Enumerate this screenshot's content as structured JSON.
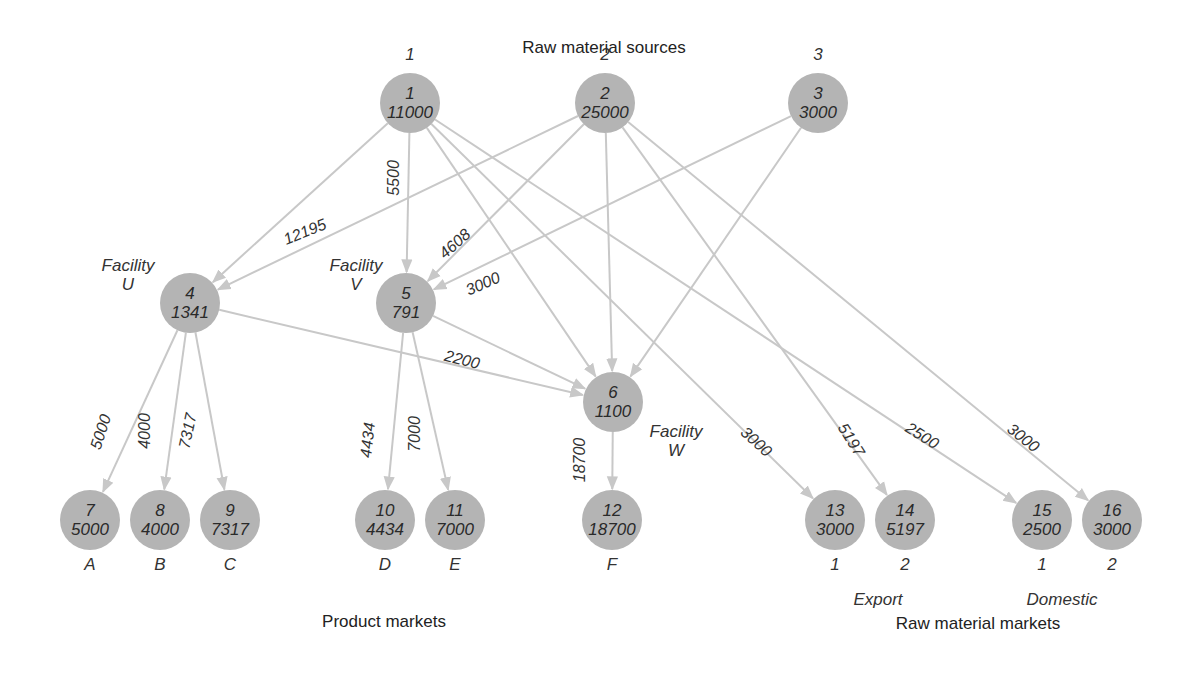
{
  "titles": {
    "sources": "Raw material sources",
    "product_markets": "Product markets",
    "raw_markets": "Raw material markets"
  },
  "colors": {
    "node_fill": "#b4b4b4",
    "edge": "#c8c8c8",
    "text": "#2a2a2a"
  },
  "nodes": [
    {
      "id": "1",
      "value": "11000",
      "x": 410,
      "y": 103,
      "above": "1"
    },
    {
      "id": "2",
      "value": "25000",
      "x": 605,
      "y": 103,
      "above": "2"
    },
    {
      "id": "3",
      "value": "3000",
      "x": 818,
      "y": 103,
      "above": "3"
    },
    {
      "id": "4",
      "value": "1341",
      "x": 190,
      "y": 303
    },
    {
      "id": "5",
      "value": "791",
      "x": 406,
      "y": 303
    },
    {
      "id": "6",
      "value": "1100",
      "x": 613,
      "y": 402
    },
    {
      "id": "7",
      "value": "5000",
      "x": 90,
      "y": 520,
      "below": "A"
    },
    {
      "id": "8",
      "value": "4000",
      "x": 160,
      "y": 520,
      "below": "B"
    },
    {
      "id": "9",
      "value": "7317",
      "x": 230,
      "y": 520,
      "below": "C"
    },
    {
      "id": "10",
      "value": "4434",
      "x": 385,
      "y": 520,
      "below": "D"
    },
    {
      "id": "11",
      "value": "7000",
      "x": 455,
      "y": 520,
      "below": "E"
    },
    {
      "id": "12",
      "value": "18700",
      "x": 612,
      "y": 520,
      "below": "F"
    },
    {
      "id": "13",
      "value": "3000",
      "x": 835,
      "y": 520,
      "below": "1"
    },
    {
      "id": "14",
      "value": "5197",
      "x": 905,
      "y": 520,
      "below": "2"
    },
    {
      "id": "15",
      "value": "2500",
      "x": 1042,
      "y": 520,
      "below": "1"
    },
    {
      "id": "16",
      "value": "3000",
      "x": 1112,
      "y": 520,
      "below": "2"
    }
  ],
  "facility_labels": [
    {
      "line1": "Facility",
      "line2": "U",
      "x": 128,
      "y": 256
    },
    {
      "line1": "Facility",
      "line2": "V",
      "x": 356,
      "y": 256
    },
    {
      "line1": "Facility",
      "line2": "W",
      "x": 676,
      "y": 422
    }
  ],
  "group_labels": [
    {
      "text": "Export",
      "x": 878,
      "y": 590
    },
    {
      "text": "Domestic",
      "x": 1062,
      "y": 590
    }
  ],
  "edges": [
    {
      "from": "1",
      "to": "4",
      "label": ""
    },
    {
      "from": "1",
      "to": "5",
      "label": "5500",
      "lx": 394,
      "ly": 178,
      "rot": -90
    },
    {
      "from": "1",
      "to": "6",
      "label": ""
    },
    {
      "from": "1",
      "to": "13",
      "label": "3000",
      "lx": 756,
      "ly": 442,
      "rot": 42
    },
    {
      "from": "1",
      "to": "15",
      "label": "2500",
      "lx": 922,
      "ly": 436,
      "rot": 32
    },
    {
      "from": "2",
      "to": "4",
      "label": "12195",
      "lx": 305,
      "ly": 232,
      "rot": -22
    },
    {
      "from": "2",
      "to": "5",
      "label": "4608",
      "lx": 455,
      "ly": 244,
      "rot": -42
    },
    {
      "from": "2",
      "to": "6",
      "label": ""
    },
    {
      "from": "2",
      "to": "14",
      "label": "5197",
      "lx": 851,
      "ly": 440,
      "rot": 58
    },
    {
      "from": "2",
      "to": "16",
      "label": "3000",
      "lx": 1023,
      "ly": 438,
      "rot": 38
    },
    {
      "from": "3",
      "to": "5",
      "label": "3000",
      "lx": 483,
      "ly": 284,
      "rot": -24
    },
    {
      "from": "3",
      "to": "6",
      "label": ""
    },
    {
      "from": "4",
      "to": "6",
      "label": "2200",
      "lx": 462,
      "ly": 360,
      "rot": 14
    },
    {
      "from": "4",
      "to": "7",
      "label": "5000",
      "lx": 101,
      "ly": 432,
      "rot": -72
    },
    {
      "from": "4",
      "to": "8",
      "label": "4000",
      "lx": 145,
      "ly": 431,
      "rot": -90
    },
    {
      "from": "4",
      "to": "9",
      "label": "7317",
      "lx": 188,
      "ly": 431,
      "rot": -78
    },
    {
      "from": "5",
      "to": "6",
      "label": ""
    },
    {
      "from": "5",
      "to": "10",
      "label": "4434",
      "lx": 368,
      "ly": 440,
      "rot": -84
    },
    {
      "from": "5",
      "to": "11",
      "label": "7000",
      "lx": 415,
      "ly": 434,
      "rot": -90
    },
    {
      "from": "6",
      "to": "12",
      "label": "18700",
      "lx": 580,
      "ly": 460,
      "rot": -90
    }
  ]
}
